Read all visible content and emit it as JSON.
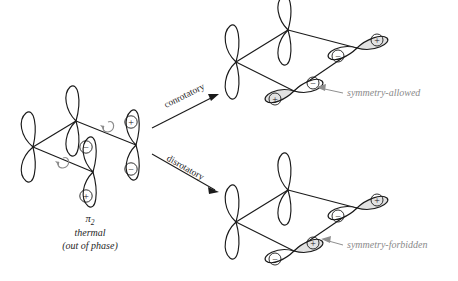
{
  "figure": {
    "background_color": "#ffffff",
    "line_color": "#1a1a1a",
    "annotation_color": "#8a8a8a",
    "shade_color": "#e2e2e2"
  },
  "reactant": {
    "orbital_label": "π",
    "orbital_subscript": "2",
    "caption_line1": "thermal",
    "caption_line2": "(out of phase)",
    "lobe_signs": {
      "front_top": "−",
      "front_bottom": "+",
      "right_top": "+",
      "right_bottom": "−"
    },
    "rotation_arrows": 2
  },
  "pathways": [
    {
      "id": "conrotatory",
      "label": "conrotatory",
      "result_label": "symmetry-allowed",
      "product_signs": {
        "front_upper": "−",
        "front_lower": "+",
        "right_upper": "+",
        "right_lower": "−"
      }
    },
    {
      "id": "disrotatory",
      "label": "disrotatory",
      "result_label": "symmetry-forbidden",
      "product_signs": {
        "front_upper": "+",
        "front_lower": "−",
        "right_upper": "+",
        "right_lower": "−"
      }
    }
  ]
}
